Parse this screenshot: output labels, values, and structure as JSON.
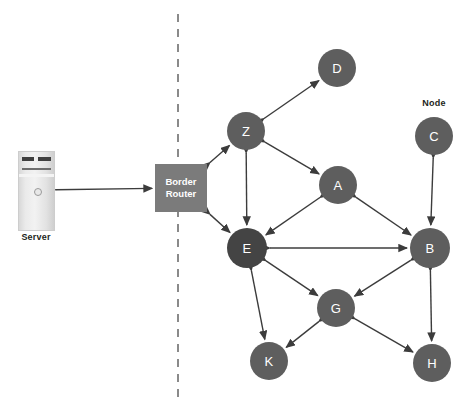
{
  "diagram": {
    "background": "#ffffff",
    "boundary_line": {
      "name": "network-boundary",
      "style": "dashed",
      "color": "#8a8a8a",
      "x": 178,
      "y1": 14,
      "y2": 400
    },
    "server": {
      "label": "Server",
      "x": 18,
      "y": 151,
      "w": 35,
      "h": 78,
      "label_x": 12,
      "label_y": 232,
      "label_w": 48
    },
    "router": {
      "line1": "Border",
      "line2": "Router",
      "color": "#7b7b7b",
      "text_color": "#ffffff",
      "x": 155,
      "y": 164,
      "w": 52,
      "h": 48
    },
    "node_label": {
      "text": "Node",
      "x": 412,
      "y": 98,
      "w": 44
    },
    "nodes": [
      {
        "id": "D",
        "label": "D",
        "cx": 337,
        "cy": 68,
        "r": 19,
        "color": "#5e5e5e"
      },
      {
        "id": "Z",
        "label": "Z",
        "cx": 246,
        "cy": 131,
        "r": 19,
        "color": "#5e5e5e"
      },
      {
        "id": "C",
        "label": "C",
        "cx": 434,
        "cy": 136,
        "r": 19,
        "color": "#5e5e5e"
      },
      {
        "id": "A",
        "label": "A",
        "cx": 338,
        "cy": 185,
        "r": 19,
        "color": "#5e5e5e"
      },
      {
        "id": "E",
        "label": "E",
        "cx": 247,
        "cy": 248,
        "r": 20,
        "color": "#444444"
      },
      {
        "id": "B",
        "label": "B",
        "cx": 430,
        "cy": 248,
        "r": 20,
        "color": "#5e5e5e"
      },
      {
        "id": "G",
        "label": "G",
        "cx": 336,
        "cy": 308,
        "r": 19,
        "color": "#5e5e5e"
      },
      {
        "id": "K",
        "label": "K",
        "cx": 269,
        "cy": 361,
        "r": 19,
        "color": "#5e5e5e"
      },
      {
        "id": "H",
        "label": "H",
        "cx": 432,
        "cy": 363,
        "r": 19,
        "color": "#5e5e5e"
      }
    ],
    "links": [
      {
        "from": "Server",
        "to": "BorderRouter",
        "arrows": "both"
      },
      {
        "from": "BorderRouter",
        "to": "Z",
        "arrows": "both"
      },
      {
        "from": "BorderRouter",
        "to": "E",
        "arrows": "both"
      },
      {
        "from": "Z",
        "to": "D",
        "arrows": "both"
      },
      {
        "from": "Z",
        "to": "A",
        "arrows": "both"
      },
      {
        "from": "Z",
        "to": "E",
        "arrows": "both"
      },
      {
        "from": "A",
        "to": "E",
        "arrows": "both"
      },
      {
        "from": "A",
        "to": "B",
        "arrows": "both"
      },
      {
        "from": "E",
        "to": "B",
        "arrows": "both"
      },
      {
        "from": "E",
        "to": "G",
        "arrows": "both"
      },
      {
        "from": "E",
        "to": "K",
        "arrows": "both"
      },
      {
        "from": "C",
        "to": "B",
        "arrows": "both"
      },
      {
        "from": "B",
        "to": "G",
        "arrows": "both"
      },
      {
        "from": "B",
        "to": "H",
        "arrows": "both"
      },
      {
        "from": "G",
        "to": "K",
        "arrows": "both"
      },
      {
        "from": "G",
        "to": "H",
        "arrows": "both"
      }
    ],
    "edge_color": "#3c3c3c"
  }
}
